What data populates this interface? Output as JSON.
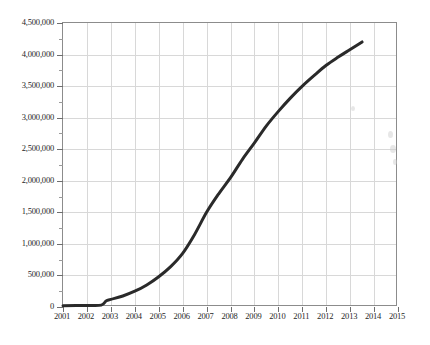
{
  "chart_data": {
    "type": "line",
    "title": "",
    "subtitle": "",
    "xlabel": "",
    "ylabel": "",
    "xlim": [
      2001,
      2015
    ],
    "ylim": [
      0,
      4500000
    ],
    "grid": true,
    "legend": null,
    "legend_position": "none",
    "line_color": "#2a2a2a",
    "grid_color": "#d8d8d8",
    "axis_color": "#8c8c8c",
    "background_color": "#ffffff",
    "x_tick_labels": [
      "2001",
      "2002",
      "2003",
      "2004",
      "2005",
      "2006",
      "2007",
      "2008",
      "2009",
      "2010",
      "2011",
      "2012",
      "2013",
      "2014",
      "2015"
    ],
    "x_ticks": [
      2001,
      2002,
      2003,
      2004,
      2005,
      2006,
      2007,
      2008,
      2009,
      2010,
      2011,
      2012,
      2013,
      2014,
      2015
    ],
    "y_tick_labels": [
      "0",
      "500,000",
      "1,000,000",
      "1,500,000",
      "2,000,000",
      "2,500,000",
      "3,000,000",
      "3,500,000",
      "4,000,000",
      "4,500,000"
    ],
    "y_ticks": [
      0,
      500000,
      1000000,
      1500000,
      2000000,
      2500000,
      3000000,
      3500000,
      4000000,
      4500000
    ],
    "series": [
      {
        "name": "series-1",
        "x": [
          2001,
          2002,
          2002.6,
          2002.8,
          2003,
          2003.5,
          2004,
          2004.5,
          2005,
          2005.5,
          2006,
          2006.5,
          2007,
          2007.5,
          2008,
          2008.5,
          2009,
          2009.5,
          2010,
          2010.5,
          2011,
          2011.5,
          2012,
          2012.5,
          2013,
          2013.5
        ],
        "values": [
          20000,
          25000,
          30000,
          95000,
          120000,
          175000,
          250000,
          350000,
          480000,
          640000,
          850000,
          1150000,
          1500000,
          1790000,
          2050000,
          2340000,
          2600000,
          2870000,
          3100000,
          3310000,
          3500000,
          3670000,
          3830000,
          3960000,
          4080000,
          4200000
        ]
      }
    ]
  }
}
